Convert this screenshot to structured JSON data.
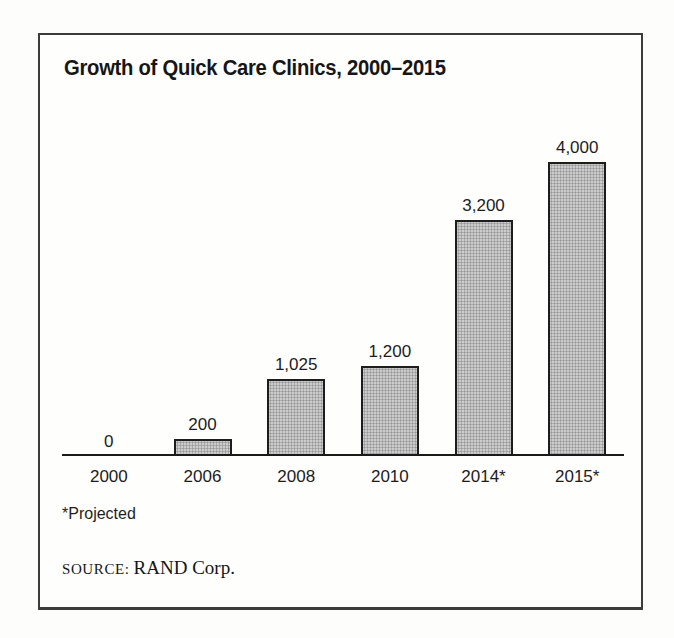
{
  "panel": {
    "title": "Growth of Quick Care Clinics, 2000–2015",
    "footnote": "*Projected",
    "source_label": "SOURCE:",
    "source_value": "RAND Corp."
  },
  "chart_data": {
    "type": "bar",
    "title": "Growth of Quick Care Clinics, 2000–2015",
    "categories": [
      "2000",
      "2006",
      "2008",
      "2010",
      "2014*",
      "2015*"
    ],
    "values": [
      0,
      200,
      1025,
      1200,
      3200,
      4000
    ],
    "value_labels": [
      "0",
      "200",
      "1,025",
      "1,200",
      "3,200",
      "4,000"
    ],
    "xlabel": "",
    "ylabel": "",
    "ylim": [
      0,
      4000
    ],
    "grid": false,
    "legend": false,
    "bar_color": "#cccccc",
    "bar_border_color": "#1d1d1d",
    "axis_color": "#1a1a1a",
    "annotations": [
      "*Projected",
      "SOURCE: RAND Corp."
    ]
  }
}
